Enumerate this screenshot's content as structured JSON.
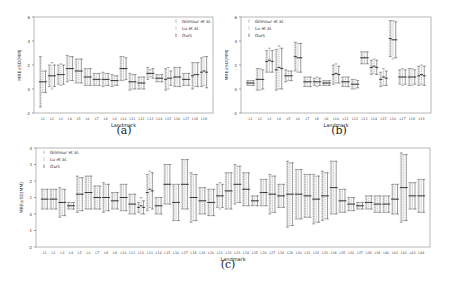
{
  "legend": {
    "entries": [
      "Gilmour et al.",
      "Lu et al.",
      "Ours"
    ]
  },
  "chart_data": [
    {
      "id": "a",
      "type": "errorbar",
      "caption": "(a)",
      "xlabel": "Landmark",
      "ylabel": "MRE±SD(MM)",
      "ylim": [
        -2,
        6
      ],
      "yticks": [
        -2,
        0,
        2,
        4,
        6
      ],
      "legend_position": "upper right",
      "grid": false,
      "categories": [
        "L1",
        "L2",
        "L3",
        "L4",
        "L5",
        "L6",
        "L7",
        "L8",
        "L9",
        "L10",
        "L11",
        "L12",
        "L13",
        "L14",
        "L15",
        "L16",
        "L17",
        "L18",
        "L19"
      ],
      "series": [
        {
          "name": "Gilmour et al.",
          "mean": [
            0.6,
            1.1,
            1.2,
            1.7,
            1.5,
            1.0,
            0.8,
            0.8,
            0.7,
            1.7,
            0.6,
            0.5,
            1.3,
            0.9,
            0.8,
            1.0,
            0.8,
            1.1,
            1.4
          ],
          "sd": [
            2.1,
            0.9,
            0.8,
            1.1,
            1.0,
            0.7,
            0.5,
            0.6,
            0.5,
            1.0,
            0.7,
            0.5,
            0.5,
            0.3,
            0.9,
            0.8,
            0.5,
            1.1,
            1.2
          ]
        },
        {
          "name": "Lu et al.",
          "mean": [
            0.6,
            1.1,
            1.2,
            1.7,
            1.5,
            1.0,
            0.8,
            0.8,
            0.7,
            1.7,
            0.6,
            0.5,
            1.3,
            0.9,
            0.9,
            1.0,
            0.8,
            1.2,
            1.5
          ],
          "sd": [
            0.9,
            1.1,
            0.9,
            1.0,
            1.0,
            0.7,
            0.5,
            0.5,
            0.4,
            1.0,
            0.6,
            0.5,
            0.3,
            0.3,
            0.9,
            0.8,
            0.5,
            1.0,
            1.2
          ]
        },
        {
          "name": "Ours",
          "mean": [
            0.6,
            1.1,
            1.2,
            1.7,
            1.5,
            1.0,
            0.8,
            0.8,
            0.7,
            1.7,
            0.6,
            0.5,
            1.3,
            0.9,
            0.9,
            1.0,
            0.8,
            1.2,
            1.4
          ],
          "sd": [
            0.9,
            0.9,
            0.8,
            1.0,
            1.0,
            0.7,
            0.5,
            0.5,
            0.4,
            0.9,
            0.6,
            0.5,
            0.4,
            0.3,
            0.6,
            0.8,
            0.5,
            1.0,
            1.3
          ]
        }
      ]
    },
    {
      "id": "b",
      "type": "errorbar",
      "caption": "(b)",
      "xlabel": "Landmark",
      "ylabel": "MRE±SD(MM)",
      "ylim": [
        -2,
        6
      ],
      "yticks": [
        -2,
        0,
        2,
        4,
        6
      ],
      "legend_position": "upper left",
      "grid": false,
      "categories": [
        "L1",
        "L2",
        "L3",
        "L4",
        "L5",
        "L6",
        "L7",
        "L8",
        "L9",
        "L10",
        "L11",
        "L12",
        "L13",
        "L14",
        "L15",
        "L16",
        "L17",
        "L18",
        "L19"
      ],
      "series": [
        {
          "name": "Gilmour et al.",
          "mean": [
            0.5,
            0.8,
            2.3,
            1.6,
            1.1,
            2.7,
            0.6,
            0.6,
            0.5,
            1.2,
            0.6,
            0.4,
            2.6,
            1.8,
            0.8,
            4.2,
            1.0,
            1.0,
            1.1
          ],
          "sd": [
            0.2,
            0.9,
            0.9,
            1.7,
            0.5,
            1.2,
            0.4,
            0.3,
            0.2,
            0.8,
            0.4,
            0.4,
            0.5,
            0.6,
            0.6,
            1.5,
            0.6,
            0.7,
            0.8
          ]
        },
        {
          "name": "Lu et al.",
          "mean": [
            0.5,
            0.8,
            2.4,
            1.8,
            1.1,
            2.6,
            0.6,
            0.6,
            0.5,
            1.3,
            0.6,
            0.4,
            2.6,
            1.9,
            1.0,
            4.1,
            1.0,
            1.0,
            1.2
          ],
          "sd": [
            0.2,
            0.9,
            1.0,
            1.8,
            0.4,
            1.2,
            0.4,
            0.4,
            0.2,
            0.8,
            0.4,
            0.4,
            0.5,
            0.6,
            0.7,
            1.6,
            0.7,
            0.7,
            0.8
          ]
        },
        {
          "name": "Ours",
          "mean": [
            0.5,
            0.8,
            2.3,
            1.7,
            1.1,
            2.6,
            0.6,
            0.6,
            0.5,
            1.2,
            0.6,
            0.4,
            2.6,
            1.8,
            0.9,
            4.1,
            1.0,
            1.0,
            1.1
          ],
          "sd": [
            0.2,
            0.8,
            0.9,
            1.7,
            0.4,
            1.2,
            0.4,
            0.3,
            0.2,
            0.7,
            0.4,
            0.3,
            0.5,
            0.6,
            0.6,
            1.5,
            0.6,
            0.6,
            0.8
          ]
        }
      ]
    },
    {
      "id": "c",
      "type": "errorbar",
      "caption": "(c)",
      "xlabel": "Landmark",
      "ylabel": "MRE±SD(MM)",
      "ylim": [
        -2,
        4
      ],
      "yticks": [
        -2,
        -1,
        0,
        1,
        2,
        3,
        4
      ],
      "legend_position": "upper left",
      "grid": false,
      "categories": [
        "L1",
        "L2",
        "L3",
        "L4",
        "L5",
        "L6",
        "L7",
        "L8",
        "L9",
        "L10",
        "L11",
        "L12",
        "L13",
        "L14",
        "L15",
        "L16",
        "L17",
        "L18",
        "L19",
        "L20",
        "L21",
        "L22",
        "L23",
        "L24",
        "L25",
        "L26",
        "L27",
        "L28",
        "L29",
        "L30",
        "L31",
        "L32",
        "L33",
        "L34",
        "L35",
        "L36",
        "L37",
        "L38",
        "L39",
        "L40",
        "L41",
        "L42",
        "L43",
        "L44"
      ],
      "series": [
        {
          "name": "Gilmour et al.",
          "mean": [
            0.9,
            0.9,
            0.7,
            0.5,
            1.2,
            1.3,
            1.0,
            1.0,
            0.8,
            1.0,
            0.6,
            0.4,
            1.3,
            0.5,
            1.8,
            0.7,
            1.8,
            1.0,
            0.8,
            0.7,
            1.1,
            1.4,
            1.8,
            1.5,
            0.8,
            1.3,
            1.2,
            1.1,
            1.2,
            1.2,
            1.1,
            0.9,
            1.1,
            1.6,
            0.8,
            0.6,
            0.5,
            0.7,
            0.6,
            0.6,
            0.9,
            1.6,
            1.1,
            1.1
          ],
          "sd": [
            0.6,
            0.6,
            0.9,
            0.2,
            1.1,
            1.0,
            0.7,
            0.9,
            0.5,
            0.8,
            0.6,
            0.3,
            1.1,
            0.5,
            1.2,
            1.1,
            1.5,
            1.5,
            0.8,
            0.8,
            0.7,
            1.1,
            1.2,
            1.0,
            0.3,
            0.8,
            1.2,
            0.7,
            2.0,
            1.5,
            1.3,
            1.5,
            1.5,
            1.6,
            0.7,
            0.4,
            0.2,
            0.4,
            0.5,
            0.5,
            0.9,
            2.1,
            0.8,
            1.0
          ]
        },
        {
          "name": "Lu et al.",
          "mean": [
            0.9,
            0.9,
            0.7,
            0.5,
            1.2,
            1.3,
            1.0,
            1.0,
            0.8,
            1.0,
            0.6,
            0.5,
            1.5,
            0.5,
            1.8,
            0.7,
            1.8,
            1.0,
            0.8,
            0.7,
            1.1,
            1.4,
            1.8,
            1.5,
            0.8,
            1.3,
            1.2,
            1.1,
            1.2,
            1.2,
            1.1,
            0.9,
            1.1,
            1.6,
            0.8,
            0.6,
            0.5,
            0.7,
            0.6,
            0.6,
            0.9,
            1.6,
            1.1,
            1.1
          ],
          "sd": [
            0.6,
            0.6,
            0.8,
            0.2,
            1.0,
            1.0,
            0.7,
            0.8,
            0.5,
            0.8,
            0.6,
            0.5,
            1.1,
            0.5,
            1.2,
            1.1,
            1.5,
            1.4,
            0.8,
            0.8,
            0.8,
            1.1,
            1.1,
            1.0,
            0.3,
            0.8,
            1.1,
            0.7,
            1.9,
            1.5,
            1.3,
            1.4,
            1.4,
            1.6,
            0.7,
            0.4,
            0.2,
            0.4,
            0.5,
            0.5,
            0.9,
            2.0,
            0.8,
            1.0
          ]
        },
        {
          "name": "Ours",
          "mean": [
            0.9,
            0.9,
            0.7,
            0.5,
            1.2,
            1.3,
            1.0,
            1.0,
            0.8,
            1.0,
            0.6,
            0.4,
            1.4,
            0.5,
            1.8,
            0.7,
            1.8,
            1.0,
            0.8,
            0.7,
            1.1,
            1.4,
            1.8,
            1.5,
            0.8,
            1.3,
            1.2,
            1.1,
            1.2,
            1.2,
            1.1,
            0.9,
            1.1,
            1.6,
            0.8,
            0.6,
            0.5,
            0.7,
            0.6,
            0.6,
            0.9,
            1.6,
            1.1,
            1.1
          ],
          "sd": [
            0.6,
            0.6,
            0.8,
            0.2,
            1.0,
            1.0,
            0.7,
            0.8,
            0.5,
            0.8,
            0.6,
            0.4,
            1.1,
            0.5,
            1.2,
            1.1,
            1.5,
            1.4,
            0.8,
            0.8,
            0.7,
            1.1,
            1.1,
            1.0,
            0.3,
            0.8,
            1.1,
            0.7,
            1.9,
            1.5,
            1.3,
            1.4,
            1.4,
            1.6,
            0.7,
            0.4,
            0.2,
            0.4,
            0.5,
            0.5,
            0.9,
            2.0,
            0.8,
            1.0
          ]
        }
      ]
    }
  ]
}
